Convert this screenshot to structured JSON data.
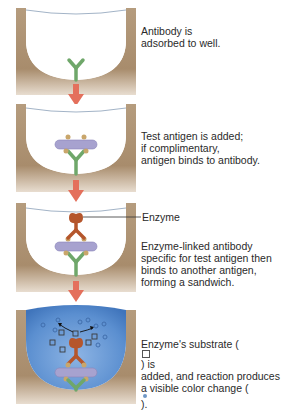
{
  "diagram": {
    "colors": {
      "well_wall": "#b59c7e",
      "well_shadow": "#8e7658",
      "antibody_capture": "#6fa76a",
      "antigen": "#a7a2cf",
      "antigen_sites": "#c9a66b",
      "enzyme_antibody": "#b5562c",
      "arrow": "#e4705c",
      "solution": "#5b8fd0",
      "product_dot": "#6e97c6"
    },
    "steps": [
      {
        "id": 1,
        "lines": [
          "Antibody is",
          "adsorbed to well."
        ]
      },
      {
        "id": 2,
        "lines": [
          "Test antigen is added;",
          "if complimentary,",
          "antigen binds to antibody."
        ]
      },
      {
        "id": 3,
        "callout": "Enzyme",
        "lines": [
          "Enzyme-linked antibody",
          "specific for test antigen then",
          "binds to another antigen,",
          "forming a sandwich."
        ]
      },
      {
        "id": 4,
        "line1_pre": "Enzyme's substrate (",
        "line1_post": ") is",
        "line2": "added, and reaction produces",
        "line3_pre": "a visible color change (",
        "line3_post": ")."
      }
    ],
    "legend_icons": {
      "substrate": "square-substrate-icon",
      "product": "circle-product-icon"
    }
  }
}
